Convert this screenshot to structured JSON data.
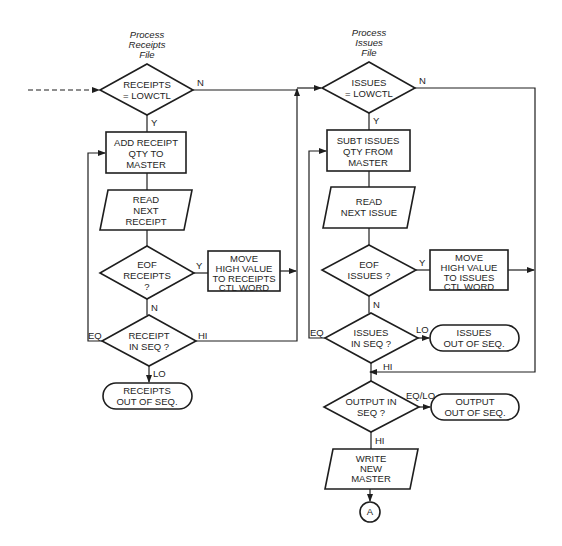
{
  "diagram": {
    "colors": {
      "ink": "#1e1e1e",
      "background": "#ffffff"
    },
    "left_column": {
      "title": [
        "Process",
        "Receipts",
        "File"
      ],
      "decision_receipts_lowctl": {
        "lines": [
          "RECEIPTS",
          "= LOWCTL"
        ],
        "yes": "Y",
        "no": "N"
      },
      "process_add_receipt": {
        "lines": [
          "ADD RECEIPT",
          "QTY TO",
          "MASTER"
        ]
      },
      "io_read_receipt": {
        "lines": [
          "READ",
          "NEXT",
          "RECEIPT"
        ]
      },
      "decision_eof_receipts": {
        "lines": [
          "EOF",
          "RECEIPTS",
          "?"
        ],
        "yes": "Y",
        "no": "N"
      },
      "process_move_high_receipts": {
        "lines": [
          "MOVE",
          "HIGH VALUE",
          "TO RECEIPTS",
          "CTL WORD"
        ]
      },
      "decision_receipt_in_seq": {
        "lines": [
          "RECEIPT",
          "IN SEQ ?"
        ],
        "eq": "EQ",
        "hi": "HI",
        "lo": "LO"
      },
      "terminal_receipts_out_of_seq": {
        "lines": [
          "RECEIPTS",
          "OUT OF SEQ."
        ]
      }
    },
    "right_column": {
      "title": [
        "Process",
        "Issues",
        "File"
      ],
      "decision_issues_lowctl": {
        "lines": [
          "ISSUES",
          "= LOWCTL"
        ],
        "yes": "Y",
        "no": "N"
      },
      "process_subt_issues": {
        "lines": [
          "SUBT ISSUES",
          "QTY FROM",
          "MASTER"
        ]
      },
      "io_read_issue": {
        "lines": [
          "READ",
          "NEXT ISSUE"
        ]
      },
      "decision_eof_issues": {
        "lines": [
          "EOF",
          "ISSUES ?"
        ],
        "yes": "Y",
        "no": "N"
      },
      "process_move_high_issues": {
        "lines": [
          "MOVE",
          "HIGH VALUE",
          "TO ISSUES",
          "CTL WORD"
        ]
      },
      "decision_issues_in_seq": {
        "lines": [
          "ISSUES",
          "IN SEQ ?"
        ],
        "eq": "EQ",
        "lo": "LO",
        "hi": "HI"
      },
      "terminal_issues_out_of_seq": {
        "lines": [
          "ISSUES",
          "OUT OF SEQ."
        ]
      },
      "decision_output_in_seq": {
        "lines": [
          "OUTPUT IN",
          "SEQ ?"
        ],
        "eqlo": "EQ/LO",
        "hi": "HI"
      },
      "terminal_output_out_of_seq": {
        "lines": [
          "OUTPUT",
          "OUT OF SEQ."
        ]
      },
      "io_write_master": {
        "lines": [
          "WRITE",
          "NEW",
          "MASTER"
        ]
      },
      "connector_a": {
        "label": "A"
      }
    }
  }
}
